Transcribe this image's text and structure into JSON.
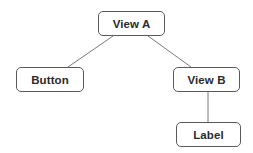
{
  "diagram": {
    "type": "tree",
    "colors": {
      "node_border": "#5a5a5a",
      "node_fill": "#ffffff",
      "node_text": "#2a2a2a",
      "edge": "#7a7a7a",
      "background": "#ffffff"
    },
    "nodes": [
      {
        "id": "view-a",
        "label": "View A",
        "x": 98,
        "y": 11,
        "w": 67,
        "h": 25
      },
      {
        "id": "button",
        "label": "Button",
        "x": 16,
        "y": 67,
        "w": 68,
        "h": 25
      },
      {
        "id": "view-b",
        "label": "View B",
        "x": 173,
        "y": 67,
        "w": 67,
        "h": 25
      },
      {
        "id": "label",
        "label": "Label",
        "x": 176,
        "y": 122,
        "w": 65,
        "h": 25
      }
    ],
    "edges": [
      {
        "from": "view-a",
        "to": "button",
        "x1": 113,
        "y1": 36,
        "x2": 68,
        "y2": 67
      },
      {
        "from": "view-a",
        "to": "view-b",
        "x1": 148,
        "y1": 36,
        "x2": 191,
        "y2": 67
      },
      {
        "from": "view-b",
        "to": "label",
        "x1": 208,
        "y1": 92,
        "x2": 208,
        "y2": 122
      }
    ]
  }
}
